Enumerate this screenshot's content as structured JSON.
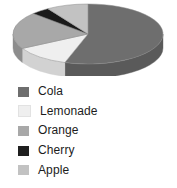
{
  "chart_data": {
    "type": "pie",
    "title": "",
    "subtitle": "",
    "xlabel": "",
    "ylabel": "",
    "grid": false,
    "legend_position": "bottom-left",
    "three_d": true,
    "categories": [
      "Cola",
      "Lemonade",
      "Orange",
      "Cherry",
      "Apple"
    ],
    "values": [
      55,
      12,
      20,
      4,
      9
    ],
    "slices": [
      {
        "label": "Cola",
        "value": 55,
        "color": "#6e6e6e",
        "side_color": "#5a5a5a"
      },
      {
        "label": "Lemonade",
        "value": 12,
        "color": "#efefef",
        "side_color": "#d2d2d2"
      },
      {
        "label": "Orange",
        "value": 20,
        "color": "#a8a8a8",
        "side_color": "#8d8d8d"
      },
      {
        "label": "Cherry",
        "value": 4,
        "color": "#1a1a1a",
        "side_color": "#111111"
      },
      {
        "label": "Apple",
        "value": 9,
        "color": "#c2c2c2",
        "side_color": "#a5a5a5"
      }
    ]
  },
  "legend": {
    "items": [
      {
        "label": "Cola",
        "color": "#6e6e6e"
      },
      {
        "label": "Lemonade",
        "color": "#efefef"
      },
      {
        "label": "Orange",
        "color": "#a8a8a8"
      },
      {
        "label": "Cherry",
        "color": "#1f1f1f"
      },
      {
        "label": "Apple",
        "color": "#c2c2c2"
      }
    ]
  },
  "colors": {
    "background": "#ffffff",
    "text": "#1c1c1c",
    "outline": "#8a8a8a"
  }
}
